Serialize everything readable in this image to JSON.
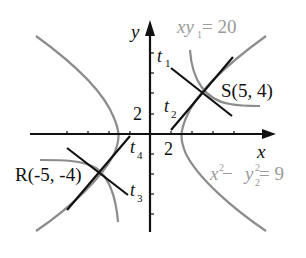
{
  "diagram": {
    "axes": {
      "x_label": "x",
      "y_label": "y",
      "x_tick_label": "2",
      "y_tick_label": "2"
    },
    "curves": {
      "hyperbola_xy": {
        "label_main": "xy",
        "label_sub": "1",
        "label_rest": " = 20"
      },
      "hyperbola_x2y2": {
        "label_x": "x",
        "label_x_sup": "2",
        "label_minus": " − ",
        "label_y": "y",
        "label_y_sup": "2",
        "label_y_sub": "2",
        "label_rest": " = 9"
      }
    },
    "points": {
      "S": {
        "label": "S(5, 4)"
      },
      "R": {
        "label": "R(-5, -4)"
      }
    },
    "tangents": {
      "t1": {
        "base": "t",
        "sub": "1"
      },
      "t2": {
        "base": "t",
        "sub": "2"
      },
      "t3": {
        "base": "t",
        "sub": "3"
      },
      "t4": {
        "base": "t",
        "sub": "4"
      }
    },
    "colors": {
      "axis": "#111111",
      "curve": "#8c8c8c",
      "tangent": "#111111",
      "label_gray": "#9a9a9a"
    }
  }
}
